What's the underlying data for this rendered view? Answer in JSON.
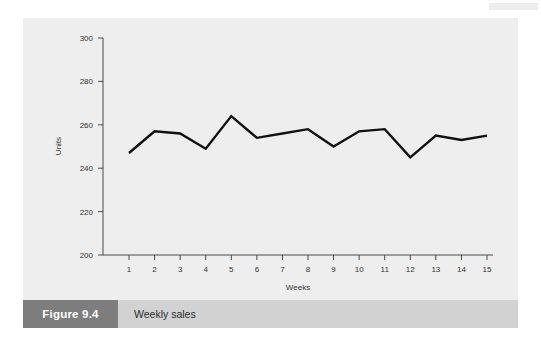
{
  "figure": {
    "tag_label": "Figure 9.4",
    "caption": "Weekly sales",
    "tag_bg_color": "#7d7d7d",
    "caption_bg_color": "#d2d2d2",
    "panel_bg_color": "#eeeeee"
  },
  "chart_data": {
    "type": "line",
    "title": "",
    "xlabel": "Weeks",
    "ylabel": "Units",
    "x": [
      1,
      2,
      3,
      4,
      5,
      6,
      7,
      8,
      9,
      10,
      11,
      12,
      13,
      14,
      15
    ],
    "categories": [
      "1",
      "2",
      "3",
      "4",
      "5",
      "6",
      "7",
      "8",
      "9",
      "10",
      "11",
      "12",
      "13",
      "14",
      "15"
    ],
    "values": [
      247,
      257,
      256,
      249,
      264,
      254,
      256,
      258,
      250,
      257,
      258,
      245,
      255,
      253,
      255
    ],
    "series": [
      {
        "name": "Weekly sales",
        "values": [
          247,
          257,
          256,
          249,
          264,
          254,
          256,
          258,
          250,
          257,
          258,
          245,
          255,
          253,
          255
        ],
        "color": "#111111"
      }
    ],
    "ylim": [
      200,
      300
    ],
    "xlim": [
      1,
      15
    ],
    "yticks": [
      200,
      220,
      240,
      260,
      280,
      300
    ],
    "ytick_labels": [
      "200",
      "220",
      "240",
      "260",
      "280",
      "300"
    ],
    "xticks": [
      1,
      2,
      3,
      4,
      5,
      6,
      7,
      8,
      9,
      10,
      11,
      12,
      13,
      14,
      15
    ],
    "xtick_labels": [
      "1",
      "2",
      "3",
      "4",
      "5",
      "6",
      "7",
      "8",
      "9",
      "10",
      "11",
      "12",
      "13",
      "14",
      "15"
    ],
    "grid": false,
    "legend": false,
    "legend_position": "none",
    "line_color": "#111111",
    "line_width": 2.4,
    "markers": false
  }
}
